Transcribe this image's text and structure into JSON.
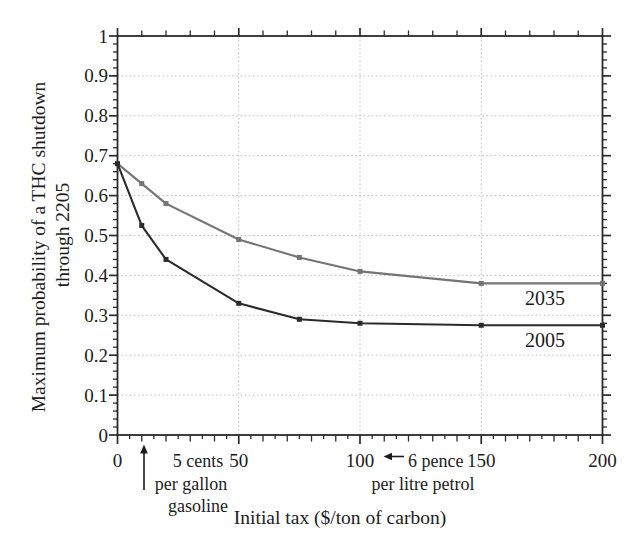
{
  "figure": {
    "background": "#ffffff",
    "axis_color": "#2a2a2a",
    "grid_color": "#bdbdbd",
    "text_color": "#1c1c1c"
  },
  "chart_data": {
    "type": "line",
    "title": "",
    "xlabel": "Initial tax  ($/ton of carbon)",
    "ylabel_lines": [
      "Maximum probability of a THC shutdown",
      "through 2205"
    ],
    "xlim": [
      0,
      200
    ],
    "ylim": [
      0,
      1
    ],
    "x_tick_values": [
      0,
      50,
      100,
      150,
      200
    ],
    "x_tick_labels": [
      "0",
      "50",
      "100",
      "150",
      "200"
    ],
    "x_minor_step_bottom": 5,
    "x_minor_step_top": 10,
    "y_tick_values": [
      0,
      0.1,
      0.2,
      0.3,
      0.4,
      0.5,
      0.6,
      0.7,
      0.8,
      0.9,
      1
    ],
    "y_tick_labels": [
      "0",
      "0.1",
      "0.2",
      "0.3",
      "0.4",
      "0.5",
      "0.6",
      "0.7",
      "0.8",
      "0.9",
      "1"
    ],
    "y_minor_step": 0.02,
    "grid": {
      "style": "dotted",
      "x_values": [
        50,
        100,
        150
      ],
      "y_values": [
        0.1,
        0.2,
        0.3,
        0.4,
        0.5,
        0.6,
        0.7,
        0.8,
        0.9
      ]
    },
    "legend_position": "inline-labels-right",
    "series": [
      {
        "name": "2035",
        "color": "#747474",
        "marker": "square",
        "x": [
          0,
          10,
          20,
          50,
          75,
          100,
          150,
          200
        ],
        "y": [
          0.68,
          0.63,
          0.58,
          0.49,
          0.445,
          0.41,
          0.38,
          0.38
        ]
      },
      {
        "name": "2005",
        "color": "#2b2b2b",
        "marker": "square",
        "x": [
          0,
          10,
          20,
          50,
          75,
          100,
          150,
          200
        ],
        "y": [
          0.68,
          0.525,
          0.44,
          0.33,
          0.29,
          0.28,
          0.275,
          0.275
        ]
      }
    ],
    "annotations": [
      {
        "id": "gasoline-equivalent",
        "arrow": "up",
        "lines": [
          "5 cents",
          "per gallon",
          "gasoline"
        ]
      },
      {
        "id": "petrol-equivalent",
        "arrow": "left",
        "lines": [
          "6 pence",
          "per litre petrol"
        ]
      }
    ]
  }
}
